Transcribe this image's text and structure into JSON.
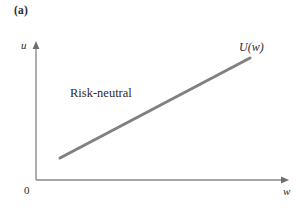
{
  "figure": {
    "panel_label": "(a)",
    "background_color": "#ffffff",
    "text_color": "#2b2b2b"
  },
  "axes": {
    "y_label": "u",
    "x_label": "w",
    "origin_label": "0",
    "axis_color": "#8a8a8a",
    "x_axis": {
      "x_start": 36,
      "x_end": 288,
      "y": 180
    },
    "y_axis": {
      "x": 36,
      "y_start": 180,
      "y_end": 42
    }
  },
  "annotations": {
    "curve_label": "U(w)",
    "shape_label": "Risk-neutral"
  },
  "chart_data": {
    "type": "line",
    "title": "(a)",
    "xlabel": "w",
    "ylabel": "u",
    "grid": false,
    "legend": "none",
    "series": [
      {
        "name": "U(w)",
        "description": "Risk-neutral",
        "color": "#808080",
        "line_width": 3,
        "x": [
          0.1,
          0.85
        ],
        "y": [
          0.16,
          0.88
        ],
        "pixel_points": [
          [
            60,
            158
          ],
          [
            250,
            58
          ]
        ]
      }
    ],
    "xlim": [
      0,
      1
    ],
    "ylim": [
      0,
      1
    ],
    "annotations": [
      "Risk-neutral",
      "U(w)"
    ]
  }
}
